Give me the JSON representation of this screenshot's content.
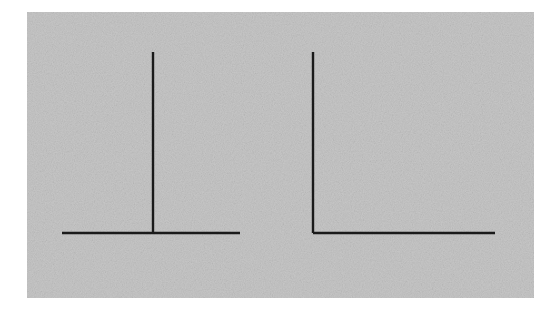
{
  "canvas": {
    "width": 557,
    "height": 312,
    "background_color": "#ffffff"
  },
  "panel": {
    "name": "stimulus-panel",
    "x": 27,
    "y": 12,
    "width": 507,
    "height": 286,
    "fill_color": "#c7c7c7",
    "noise": true,
    "noise_opacity": 0.09
  },
  "style": {
    "line_color": "#1a1a1a",
    "line_width": 2.4
  },
  "figures": [
    {
      "name": "inverted-t-figure",
      "label": "Inverted T",
      "description": "Horizontal base line with a vertical line rising from its midpoint",
      "baseline": {
        "x1": 62,
        "y1": 233,
        "x2": 240,
        "y2": 233,
        "length": 178
      },
      "upright": {
        "x1": 153,
        "y1": 52,
        "x2": 153,
        "y2": 233,
        "length": 181
      },
      "junction": {
        "x": 153,
        "y": 233,
        "type": "bisecting"
      }
    },
    {
      "name": "l-figure",
      "label": "L",
      "description": "Vertical line meeting a horizontal line at the left end, forming a right angle",
      "baseline": {
        "x1": 313,
        "y1": 233,
        "x2": 495,
        "y2": 233,
        "length": 182
      },
      "upright": {
        "x1": 313,
        "y1": 52,
        "x2": 313,
        "y2": 233,
        "length": 181
      },
      "junction": {
        "x": 313,
        "y": 233,
        "type": "corner"
      }
    }
  ],
  "chart_data": {
    "type": "line",
    "title": "",
    "xlabel": "",
    "ylabel": "",
    "series": [
      {
        "name": "t-horizontal",
        "x": [
          62,
          240
        ],
        "y": [
          233,
          233
        ]
      },
      {
        "name": "t-vertical",
        "x": [
          153,
          153
        ],
        "y": [
          52,
          233
        ]
      },
      {
        "name": "l-vertical",
        "x": [
          313,
          313
        ],
        "y": [
          52,
          233
        ]
      },
      {
        "name": "l-horizontal",
        "x": [
          313,
          495
        ],
        "y": [
          233,
          233
        ]
      }
    ],
    "xlim": [
      0,
      557
    ],
    "ylim": [
      312,
      0
    ],
    "grid": false,
    "legend": "none"
  }
}
